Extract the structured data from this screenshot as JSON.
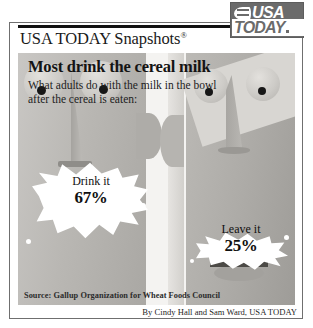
{
  "masthead": {
    "title": "USA TODAY Snapshots",
    "registered_mark": "®",
    "logo": {
      "line1": "USA",
      "line2": "TODAY",
      "globe_icon": "globe-swoosh-icon",
      "box_color": "#6b6b6b"
    }
  },
  "headline": "Most drink the cereal milk",
  "subhead": {
    "line1": "What adults do with the milk in the bowl",
    "line2": "after the cereal is eaten:"
  },
  "chart_data": {
    "type": "pie",
    "title": "Most drink the cereal milk",
    "subtitle": "What adults do with the milk in the bowl after the cereal is eaten:",
    "categories": [
      "Drink it",
      "Leave it"
    ],
    "values": [
      67,
      25
    ],
    "unit": "%",
    "labels": [
      "67%",
      "25%"
    ],
    "xlabel": "",
    "ylabel": "",
    "ylim": [
      0,
      100
    ],
    "grid": false,
    "legend": "none",
    "source": "Gallup Organization for Wheat Foods Council",
    "note": "Values shown as percentages of adults; figures do not sum to 100%."
  },
  "callouts": [
    {
      "label": "Drink it",
      "value": "67%"
    },
    {
      "label": "Leave it",
      "value": "25%"
    }
  ],
  "source_line": "Source: Gallup Organization for Wheat Foods Council",
  "credit_line": "By Cindy Hall and Sam Ward, USA TODAY",
  "illustration": {
    "description": "two stylized faces drinking cereal milk",
    "face_color": "#b6b4b0",
    "milk_color": "#ffffff"
  }
}
